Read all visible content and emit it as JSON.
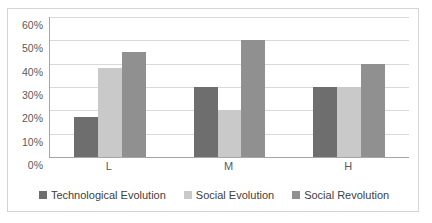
{
  "chart_data": {
    "type": "bar",
    "title": "",
    "subtitle": "",
    "xlabel": "",
    "ylabel": "",
    "categories": [
      "L",
      "M",
      "H"
    ],
    "series": [
      {
        "name": "Technological Evolution",
        "color": "#6e6e6e",
        "values": [
          17,
          30,
          30
        ],
        "value_labels": [
          "17%",
          "30%",
          "30%"
        ]
      },
      {
        "name": "Social Evolution",
        "color": "#c9c9c9",
        "values": [
          38,
          20,
          30
        ],
        "value_labels": [
          "38%",
          "20%",
          "30%"
        ]
      },
      {
        "name": "Social Revolution",
        "color": "#909090",
        "values": [
          45,
          50,
          40
        ],
        "value_labels": [
          "45%",
          "50%",
          "40%"
        ]
      }
    ],
    "ylim": [
      0,
      60
    ],
    "ytick_step": 10,
    "ytick_labels": [
      "0%",
      "10%",
      "20%",
      "30%",
      "40%",
      "50%",
      "60%"
    ],
    "ytick_values": [
      0,
      10,
      20,
      30,
      40,
      50,
      60
    ],
    "grid": true,
    "legend_position": "bottom",
    "axis_color": "#a6a6a6",
    "gridline_color": "#d9d9d9",
    "border_color": "#d4d4d4",
    "plot_background": "#ffffff"
  }
}
